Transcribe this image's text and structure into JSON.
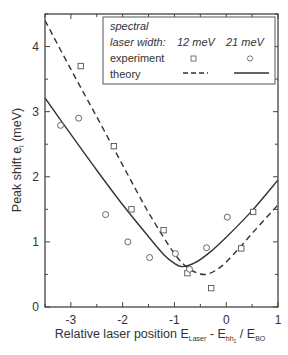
{
  "chart_data": {
    "type": "scatter",
    "title": "",
    "xlabel": "Relative laser position E_Laser - E_hh1 / E_BO",
    "xlabel_parts": {
      "main": "Relative laser position E",
      "sub1": "Laser",
      "mid": " - E",
      "sub2": "hh",
      "sub2b": "1",
      "tail": " / E",
      "sub3": "BO"
    },
    "ylabel": "Peak shift e_l (meV)",
    "ylabel_parts": {
      "main": "Peak shift e",
      "sub": "l",
      "tail": " (meV)"
    },
    "xlim": [
      -3.5,
      1
    ],
    "ylim": [
      0,
      4.5
    ],
    "xticks": [
      -3,
      -2,
      -1,
      0,
      1
    ],
    "xtick_labels": [
      "-3",
      "-2",
      "-1",
      "0",
      "1"
    ],
    "yticks": [
      0,
      1,
      2,
      3,
      4
    ],
    "ytick_labels": [
      "0",
      "1",
      "2",
      "3",
      "4"
    ],
    "grid": false,
    "legend_position": "upper right",
    "legend": {
      "title_line1": "spectral",
      "title_line2": "laser width:",
      "col1": "12 meV",
      "col2": "21 meV",
      "row_experiment": "experiment",
      "row_theory": "theory"
    },
    "series": [
      {
        "name": "experiment 12 meV",
        "marker": "square",
        "points": [
          [
            -2.81,
            3.7
          ],
          [
            -2.17,
            2.47
          ],
          [
            -1.83,
            1.5
          ],
          [
            -1.21,
            1.18
          ],
          [
            -0.75,
            0.52
          ],
          [
            -0.29,
            0.29
          ],
          [
            0.29,
            0.9
          ],
          [
            0.52,
            1.46
          ]
        ]
      },
      {
        "name": "experiment 21 meV",
        "marker": "circle",
        "points": [
          [
            -3.2,
            2.79
          ],
          [
            -2.85,
            2.9
          ],
          [
            -2.33,
            1.42
          ],
          [
            -1.9,
            1.0
          ],
          [
            -1.48,
            0.76
          ],
          [
            -0.98,
            0.82
          ],
          [
            -0.71,
            0.58
          ],
          [
            -0.38,
            0.91
          ],
          [
            0.02,
            1.38
          ]
        ]
      },
      {
        "name": "theory 12 meV",
        "style": "dashed",
        "points": [
          [
            -3.5,
            4.4
          ],
          [
            -3.0,
            3.65
          ],
          [
            -2.5,
            2.92
          ],
          [
            -2.0,
            2.18
          ],
          [
            -1.5,
            1.45
          ],
          [
            -1.0,
            0.82
          ],
          [
            -0.7,
            0.58
          ],
          [
            -0.4,
            0.5
          ],
          [
            -0.1,
            0.62
          ],
          [
            0.2,
            0.86
          ],
          [
            0.5,
            1.13
          ],
          [
            1.0,
            1.57
          ]
        ]
      },
      {
        "name": "theory 21 meV",
        "style": "solid",
        "points": [
          [
            -3.5,
            3.21
          ],
          [
            -3.0,
            2.65
          ],
          [
            -2.5,
            2.1
          ],
          [
            -2.0,
            1.57
          ],
          [
            -1.5,
            1.08
          ],
          [
            -1.2,
            0.8
          ],
          [
            -1.0,
            0.67
          ],
          [
            -0.85,
            0.62
          ],
          [
            -0.6,
            0.68
          ],
          [
            -0.3,
            0.85
          ],
          [
            0.0,
            1.07
          ],
          [
            0.5,
            1.48
          ],
          [
            1.0,
            1.95
          ]
        ]
      }
    ]
  }
}
